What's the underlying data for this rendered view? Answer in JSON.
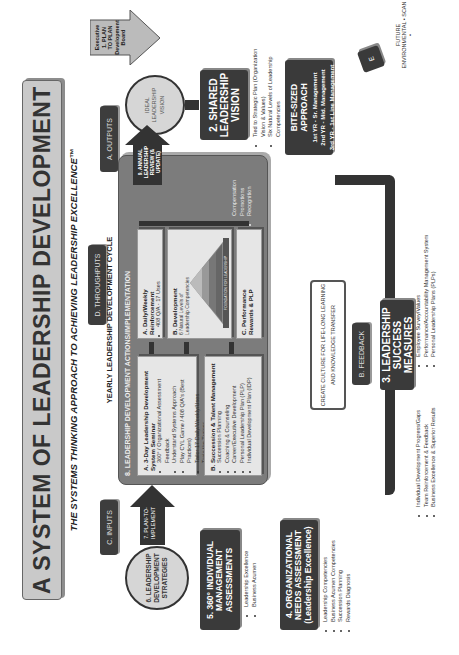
{
  "title": "A SYSTEM OF LEADERSHIP DEVELOPMENT",
  "subtitle": "THE SYSTEMS THINKING APPROACH TO ACHIEVING LEADERSHIP EXCELLENCE™",
  "labels": {
    "inputs": "C. INPUTS",
    "throughputs": "D. THROUGHPUTS",
    "outputs": "A. OUTPUTS",
    "feedback": "B. FEEDBACK",
    "environmental_scan_box": "E",
    "environmental_scan": "FUTURE ENVIRONMENTAL • SCAN •"
  },
  "executive_arrow": {
    "line1": "Executive",
    "line2": "1. PLAN",
    "line3": "TO PLAN",
    "line4": "Development",
    "line5": "Board"
  },
  "ideal_circle": {
    "line1": "IDEAL",
    "line2": "LEADERSHIP",
    "line3": "VISION"
  },
  "shared_vision": {
    "title_line1": "2. SHARED",
    "title_line2": "LEADERSHIP",
    "title_line3": "VISION",
    "bullets": [
      "Tied to Strategic Plan (Organization Vision & Values)",
      "Six Natural Levels of Leadership Competencies"
    ]
  },
  "bite_sized": {
    "title": "BITE-SIZED APPROACH",
    "lines": [
      "1st YR - Sr. Management",
      "2nd YR - Mid. Management",
      "3rd YR - 1st Line Management"
    ]
  },
  "success_measures": {
    "title_line1": "3. LEADERSHIP",
    "title_line2": "SUCCESS MEASURES",
    "bullets_left": [
      "Individual Development Progress/Gaps",
      "Team Reinforcement & Feedback",
      "Business Excellence & Superior Results"
    ],
    "bullets_right": [
      "Employee Survey/Values",
      "Performance/Accountability Management System",
      "Personal Leadership Plans (PLPs)"
    ]
  },
  "culture_box": {
    "line1": "CREATE CULTURE FOR LIFE-LONG LEARNING",
    "line2": "AND KNOWLEDGE TRANSFER"
  },
  "needs_assessment": {
    "title_line1": "4. ORGANIZATIONAL",
    "title_line2": "NEEDS ASSESSMENT",
    "title_line3": "(Leadership Excellence)",
    "bullets": [
      "Leadership Competencies",
      "Business Acumen Competencies",
      "Succession Planning",
      "Rewards Diagnosis"
    ]
  },
  "individual_assessments": {
    "title_line1": "5. 360° INDIVIDUAL",
    "title_line2": "MANAGEMENT",
    "title_line3": "ASSESSMENTS",
    "bullets": [
      "Leadership Excellence",
      "Business Acumen"
    ]
  },
  "strategies_circle": {
    "line1": "6. LEADERSHIP",
    "line2": "DEVELOPMENT",
    "line3": "STRATEGIES"
  },
  "plan_to_implement": {
    "line1": "7. PLAN-TO-",
    "line2": "IMPLEMENT"
  },
  "annual_review": {
    "line1": "9. ANNUAL LEADERSHIP",
    "line2": "REVIEW (& UPDATE)"
  },
  "yearly_cycle": "YEARLY LEADERSHIP DEVELOPMENT CYCLE",
  "panel": {
    "header": "8.   LEADERSHIP DEVELOPMENT ACTIONS/IMPLEMENTATION",
    "seminar": {
      "title": "A. 3-Day Leadership Development System Seminar",
      "bullets": [
        "360° / Organizational Assessment Feedback",
        "Understand Systems Approach",
        "Play CYL Game / 408 Q/A's (Best Practices)",
        "Tailor 17 Daily/Weekly/Uses",
        "Train the Trainer"
      ]
    },
    "succession": {
      "title": "B. Succession & Talent Management",
      "bullets": [
        "Succession Planning",
        "Coaching & Counseling",
        "Career/Executive Development",
        "Personal Leadership Plan (PLP)",
        "Individual Development Plan (IDP)"
      ]
    },
    "daily": {
      "title_line1": "A. Daily/Weekly",
      "title_line2": "Reinforcement",
      "bullets": [
        "408 Q/A - 17 Uses"
      ]
    },
    "development": {
      "title": "B. Development",
      "subtitle_line1": "6 Natural Levels of",
      "subtitle_line2": "Leadership Competencies",
      "pyramid_base": "FOUNDATION FOR LEADERSHIP",
      "pyramid_tag": "CORE"
    },
    "performance": {
      "title_line1": "C. Performance",
      "title_line2": "Rewards & PLP",
      "bullets": [
        "Compensation",
        "Promotions",
        "Recognition"
      ]
    }
  },
  "colors": {
    "dark_box": "#3a3a3a",
    "panel": "#7c7c7c",
    "light_box": "#e6e6e6",
    "title_bar": "#c9c9c9"
  }
}
